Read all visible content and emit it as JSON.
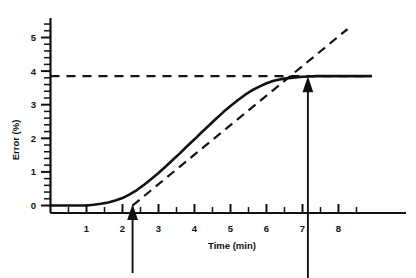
{
  "chart_data": {
    "type": "line",
    "title": "",
    "subtitle": "",
    "xlabel": "Time (min)",
    "ylabel": "Error (%)",
    "xlim": [
      0,
      8.9
    ],
    "ylim": [
      0,
      5.4
    ],
    "grid": false,
    "legend": null,
    "x_ticks": [
      1,
      2,
      3,
      4,
      5,
      6,
      7,
      8
    ],
    "x_tick_labels": [
      "1",
      "2",
      "3",
      "4",
      "5",
      "6",
      "7",
      "8"
    ],
    "x_minor_interval": 0.5,
    "y_ticks": [
      0,
      1,
      2,
      3,
      4,
      5
    ],
    "y_tick_labels": [
      "0",
      "1",
      "2",
      "3",
      "4",
      "5"
    ],
    "y_minor_interval": 0.2,
    "series": [
      {
        "name": "Error response curve",
        "style": "solid",
        "x": [
          0.0,
          0.5,
          1.0,
          1.2,
          1.4,
          1.6,
          1.8,
          2.0,
          2.2,
          2.4,
          2.6,
          2.8,
          3.0,
          3.2,
          3.4,
          3.6,
          3.8,
          4.0,
          4.2,
          4.4,
          4.6,
          4.8,
          5.0,
          5.2,
          5.4,
          5.6,
          5.8,
          6.0,
          6.2,
          6.4,
          6.6,
          6.8,
          7.0,
          7.2,
          7.4,
          7.6,
          7.8,
          8.0,
          8.3,
          8.6,
          8.9
        ],
        "y": [
          0.0,
          0.0,
          0.0,
          0.02,
          0.05,
          0.09,
          0.15,
          0.22,
          0.33,
          0.46,
          0.62,
          0.79,
          0.97,
          1.16,
          1.36,
          1.56,
          1.77,
          1.97,
          2.18,
          2.38,
          2.58,
          2.78,
          2.96,
          3.13,
          3.29,
          3.43,
          3.54,
          3.64,
          3.71,
          3.76,
          3.79,
          3.81,
          3.83,
          3.84,
          3.85,
          3.85,
          3.85,
          3.85,
          3.85,
          3.85,
          3.85
        ]
      },
      {
        "name": "Asymptote (plateau error)",
        "style": "dashed",
        "orientation": "horizontal",
        "value": 3.85,
        "x": [
          0.0,
          8.9
        ],
        "y": [
          3.85,
          3.85
        ]
      },
      {
        "name": "Tangent to linear region (extrapolated)",
        "style": "dash-dot",
        "x": [
          2.28,
          8.25
        ],
        "y": [
          0.0,
          5.25
        ],
        "slope": 0.879,
        "x_intercept": 2.28
      }
    ],
    "annotations": [
      {
        "name": "onset-arrow",
        "label": "",
        "x": 2.28,
        "y": 0.0,
        "direction": "up",
        "description": "arrow marking tangent x-intercept / onset time"
      },
      {
        "name": "completion-arrow",
        "label": "",
        "x": 7.15,
        "y": 3.8,
        "direction": "up",
        "description": "arrow marking where curve meets the plateau asymptote"
      }
    ],
    "colors": {
      "ink": "#111111",
      "background": "#ffffff"
    }
  },
  "axes": {
    "y_label": "Error (%)",
    "x_label": "Time (min)",
    "y_labels": {
      "t0": "0",
      "t1": "1",
      "t2": "2",
      "t3": "3",
      "t4": "4",
      "t5": "5"
    },
    "x_labels": {
      "t1": "1",
      "t2": "2",
      "t3": "3",
      "t4": "4",
      "t5": "5",
      "t6": "6",
      "t7": "7",
      "t8": "8"
    }
  }
}
